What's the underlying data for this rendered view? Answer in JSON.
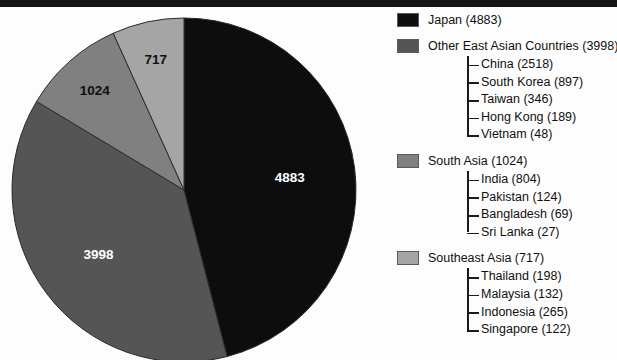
{
  "chart_data": {
    "type": "pie",
    "title": "",
    "unit_note": "",
    "total": 10622,
    "categories": [
      "Japan",
      "Other East Asian Countries",
      "South Asia",
      "Southeast Asia"
    ],
    "values": [
      4883,
      3998,
      1024,
      717
    ],
    "slice_labels": [
      "4883",
      "3998",
      "1024",
      "717"
    ],
    "colors": [
      "#0d0d0d",
      "#555555",
      "#808080",
      "#a5a5a5"
    ],
    "slice_label_colors": [
      "#ffffff",
      "#ffffff",
      "#101010",
      "#101010"
    ],
    "legend_position": "right",
    "grid": false,
    "start_angle_deg": 0,
    "direction": "clockwise",
    "breakdown": {
      "Other East Asian Countries": [
        {
          "name": "China",
          "value": 2518
        },
        {
          "name": "South Korea",
          "value": 897
        },
        {
          "name": "Taiwan",
          "value": 346
        },
        {
          "name": "Hong Kong",
          "value": 189
        },
        {
          "name": "Vietnam",
          "value": 48
        }
      ],
      "South Asia": [
        {
          "name": "India",
          "value": 804
        },
        {
          "name": "Pakistan",
          "value": 124
        },
        {
          "name": "Bangladesh",
          "value": 69
        },
        {
          "name": "Sri Lanka",
          "value": 27
        }
      ],
      "Southeast Asia": [
        {
          "name": "Thailand",
          "value": 198
        },
        {
          "name": "Malaysia",
          "value": 132
        },
        {
          "name": "Indonesia",
          "value": 265
        },
        {
          "name": "Singapore",
          "value": 122
        }
      ]
    }
  },
  "pie": {
    "slices": [
      {
        "label": "4883",
        "name": "Japan"
      },
      {
        "label": "3998",
        "name": "Other East Asian Countries"
      },
      {
        "label": "1024",
        "name": "South Asia"
      },
      {
        "label": "717",
        "name": "Southeast Asia"
      }
    ]
  },
  "legend": {
    "groups": [
      {
        "label": "Japan (4883)",
        "color": "#0d0d0d",
        "children": []
      },
      {
        "label": "Other East Asian Countries (3998)",
        "color": "#555555",
        "children": [
          "China (2518)",
          "South Korea (897)",
          "Taiwan (346)",
          "Hong Kong (189)",
          "Vietnam (48)"
        ]
      },
      {
        "label": "South Asia (1024)",
        "color": "#808080",
        "children": [
          "India (804)",
          "Pakistan (124)",
          "Bangladesh (69)",
          "Sri Lanka (27)"
        ]
      },
      {
        "label": "Southeast Asia (717)",
        "color": "#a5a5a5",
        "children": [
          "Thailand (198)",
          "Malaysia (132)",
          "Indonesia (265)",
          "Singapore (122)"
        ]
      }
    ]
  }
}
